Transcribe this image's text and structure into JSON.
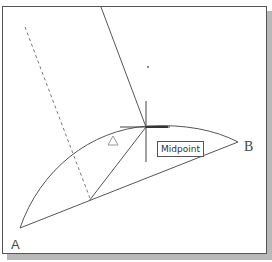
{
  "drawing": {
    "points": {
      "A": {
        "label": "A",
        "x": 20,
        "y": 228
      },
      "B": {
        "label": "B",
        "x": 238,
        "y": 142
      }
    },
    "snap": {
      "tooltip_label": "Midpoint",
      "crosshair_center": {
        "x": 146,
        "y": 127
      }
    },
    "marker": {
      "type": "triangle",
      "x": 113,
      "y": 140
    },
    "colors": {
      "line": "#555555",
      "dashed": "#777777",
      "frame": "#555555",
      "shadow": "#b8b8b8",
      "background": "#ffffff"
    }
  }
}
